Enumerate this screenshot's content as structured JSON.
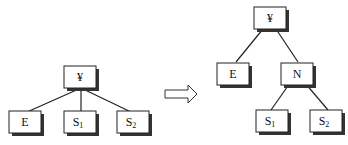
{
  "diagram": {
    "before": {
      "root": "¥",
      "children": [
        {
          "base": "E",
          "sub": ""
        },
        {
          "base": "S",
          "sub": "1"
        },
        {
          "base": "S",
          "sub": "2"
        }
      ]
    },
    "transform_arrow": "right-hollow-arrow",
    "after": {
      "root": "¥",
      "level1": [
        {
          "base": "E",
          "sub": ""
        },
        {
          "base": "N",
          "sub": ""
        }
      ],
      "level2_under_N": [
        {
          "base": "S",
          "sub": "1"
        },
        {
          "base": "S",
          "sub": "2"
        }
      ]
    }
  }
}
